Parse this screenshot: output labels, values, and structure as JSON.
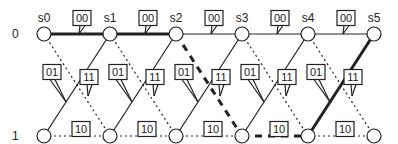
{
  "diagram": {
    "type": "trellis",
    "stages": [
      "s0",
      "s1",
      "s2",
      "s3",
      "s4",
      "s5"
    ],
    "states": [
      "0",
      "1"
    ],
    "stage_x": [
      44,
      110,
      176,
      242,
      308,
      374
    ],
    "state_y": [
      34,
      136
    ],
    "branch_labels": {
      "0to0": "00",
      "0to1": "11",
      "1to0": "01",
      "1to1": "10"
    },
    "branch_styles": {
      "0to0": "solid",
      "0to1": "dotted",
      "1to0": "solid",
      "1to1": "dotted"
    },
    "highlighted_path": [
      {
        "from_stage": 0,
        "from_state": 0,
        "to_state": 0,
        "style": "thick-solid"
      },
      {
        "from_stage": 1,
        "from_state": 0,
        "to_state": 0,
        "style": "thick-solid"
      },
      {
        "from_stage": 2,
        "from_state": 0,
        "to_state": 1,
        "style": "thick-dashed"
      },
      {
        "from_stage": 3,
        "from_state": 1,
        "to_state": 1,
        "style": "thick-dashed"
      },
      {
        "from_stage": 4,
        "from_state": 1,
        "to_state": 0,
        "style": "thick-solid"
      }
    ],
    "colors": {
      "line": "#222222",
      "node_fill": "#ffffff",
      "label_border": "#222222"
    }
  }
}
